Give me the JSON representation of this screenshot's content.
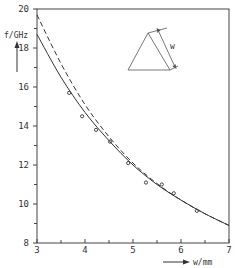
{
  "chart_data": {
    "type": "line",
    "title": "",
    "xlabel": "w/mm",
    "ylabel": "f/GHz",
    "xlim": [
      3,
      7
    ],
    "ylim": [
      8,
      20
    ],
    "x_ticks": [
      3,
      4,
      5,
      6,
      7
    ],
    "x_tick_labels": [
      "3",
      "4",
      "5",
      "6",
      "7"
    ],
    "y_ticks": [
      8,
      10,
      12,
      14,
      16,
      18,
      20
    ],
    "y_tick_labels": [
      "8",
      "10",
      "12",
      "14",
      "16",
      "18",
      "20"
    ],
    "x_minor_step": 0.5,
    "y_minor_step": 1,
    "grid": false,
    "series": [
      {
        "name": "theory (solid)",
        "style": "solid",
        "x": [
          3.0,
          3.5,
          4.0,
          4.5,
          5.0,
          5.5,
          6.0,
          6.5,
          7.0
        ],
        "y": [
          18.7,
          16.5,
          14.7,
          13.25,
          12.0,
          11.0,
          10.2,
          9.5,
          8.9
        ]
      },
      {
        "name": "theory (dashed)",
        "style": "dashed",
        "x": [
          3.0,
          3.5,
          4.0,
          4.5,
          5.0,
          5.5,
          6.0,
          6.5,
          7.0
        ],
        "y": [
          19.7,
          17.2,
          15.1,
          13.45,
          12.1,
          11.05,
          10.2,
          9.5,
          8.9
        ]
      },
      {
        "name": "measured",
        "style": "points",
        "x": [
          3.67,
          3.94,
          4.23,
          4.52,
          4.9,
          5.27,
          5.6,
          5.85,
          6.33
        ],
        "y": [
          15.7,
          14.5,
          13.8,
          13.2,
          12.1,
          11.1,
          11.0,
          10.55,
          9.65
        ]
      }
    ],
    "legend": "none",
    "annotations": [
      {
        "type": "inset-diagram",
        "label": "w",
        "description": "triangular cross-section with side width w",
        "position": "top-right"
      }
    ]
  }
}
